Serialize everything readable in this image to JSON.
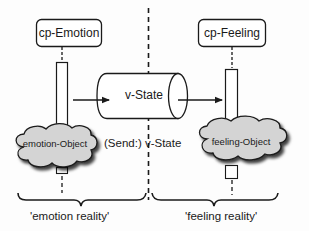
{
  "diagram": {
    "nodes": {
      "cp_emotion": {
        "label": "cp-Emotion"
      },
      "cp_feeling": {
        "label": "cp-Feeling"
      },
      "v_state": {
        "label": "v-State",
        "shape": "cylinder"
      },
      "emotion_object": {
        "label": "emotion-Object",
        "shape": "cloud"
      },
      "feeling_object": {
        "label": "feeling-Object",
        "shape": "cloud"
      }
    },
    "edges": [
      {
        "from": "emotion_bar",
        "to": "v_state",
        "style": "arrow"
      },
      {
        "from": "v_state",
        "to": "feeling_bar",
        "style": "arrow"
      }
    ],
    "send_label": "(Send:) v-State",
    "regions": {
      "left": {
        "label": "'emotion reality'"
      },
      "right": {
        "label": "'feeling reality'"
      }
    },
    "colors": {
      "stroke": "#1a1a1a",
      "cloud_fill": "#d4d4d4",
      "background": "#fdfdfd"
    }
  }
}
